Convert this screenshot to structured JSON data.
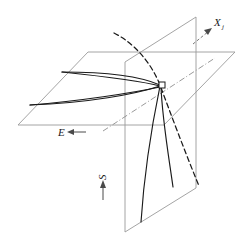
{
  "figure": {
    "background_color": "#ffffff",
    "width": 247,
    "height": 247,
    "colors": {
      "plane_edge": "#9a9a9a",
      "solid_curve": "#1a1a1a",
      "dashed_curve": "#1a1a1a",
      "dash_dot_axis": "#8e8e8e",
      "label_text": "#1a1a1a",
      "arrow": "#4a4a4a"
    }
  },
  "labels": {
    "x_axis": {
      "base": "X",
      "subscript": "j",
      "arrow": "arrow-up-right",
      "position": "top-right"
    },
    "e_axis": {
      "base": "E",
      "subscript": "",
      "arrow": "arrow-left",
      "position": "bottom-left-of-horizontal-plane"
    },
    "s_axis": {
      "base": "S",
      "subscript": "",
      "arrow": "arrow-up",
      "position": "lower-center",
      "rotation": "-90"
    }
  },
  "geometry": {
    "horizontal_plane": {
      "name": "horizontal-plane",
      "points": "18,125 88,52 235,52 164,125"
    },
    "vertical_plane": {
      "name": "vertical-plane",
      "points": "125,232 125,62 196,17 196,188"
    },
    "convergence_marker": {
      "name": "convergence-node",
      "x": 162,
      "y": 85,
      "size": 6
    },
    "dash_dot_axis": {
      "name": "dash-dot-axis",
      "path": "M 103,131 L 215,58"
    },
    "horizontal_curves": [
      {
        "name": "upper-horizontal-curve",
        "path": "M 62,72 C 100,76 138,80 160,86"
      },
      {
        "name": "lower-horizontal-curve",
        "path": "M 30,105 C 80,101 132,93 160,87"
      }
    ],
    "vertical_curves": [
      {
        "name": "left-vertical-curve",
        "path": "M 160,86 C 153,120 144,175 141,222"
      },
      {
        "name": "right-vertical-curve",
        "path": "M 161,86 C 162,118 169,158 173,187"
      }
    ],
    "connector_curves": [
      {
        "name": "upper-fan-connector",
        "path": "M 62,72 C 108,72 142,77 160,85"
      },
      {
        "name": "lower-fan-connector",
        "path": "M 30,105 C 88,103 136,94 160,86"
      }
    ],
    "dashed_curve": {
      "name": "dashed-transition-curve",
      "path": "M 114,33 C 132,42 150,60 160,85 C 170,112 185,152 199,186"
    }
  }
}
